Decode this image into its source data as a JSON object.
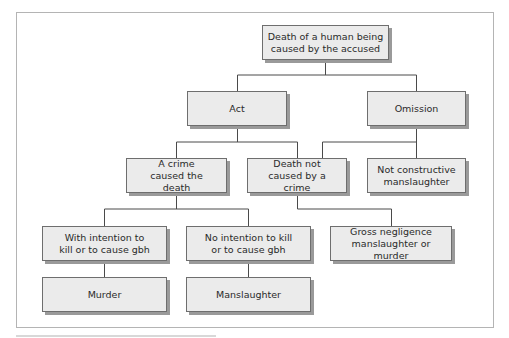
{
  "diagram": {
    "title": "",
    "nodes": [
      {
        "id": "root",
        "label": "Death of a human being caused by the accused",
        "lines": [
          "Death of a human being",
          "caused by the accused"
        ]
      },
      {
        "id": "act",
        "label": "Act",
        "lines": [
          "Act"
        ]
      },
      {
        "id": "omission",
        "label": "Omission",
        "lines": [
          "Omission"
        ]
      },
      {
        "id": "crime",
        "label": "A crime caused the death",
        "lines": [
          "A crime",
          "caused the death"
        ]
      },
      {
        "id": "not_crime",
        "label": "Death not caused by a crime",
        "lines": [
          "Death not",
          "caused by a crime"
        ]
      },
      {
        "id": "not_constructive",
        "label": "Not constructive manslaughter",
        "lines": [
          "Not constructive",
          "manslaughter"
        ]
      },
      {
        "id": "intention",
        "label": "With intention to kill or to cause gbh",
        "lines": [
          "With intention to",
          "kill or to cause gbh"
        ]
      },
      {
        "id": "no_intention",
        "label": "No intention to kill or to cause gbh",
        "lines": [
          "No intention to kill",
          "or to cause gbh"
        ]
      },
      {
        "id": "gross",
        "label": "Gross negligence manslaughter or murder",
        "lines": [
          "Gross negligence",
          "manslaughter or murder"
        ]
      },
      {
        "id": "murder",
        "label": "Murder",
        "lines": [
          "Murder"
        ]
      },
      {
        "id": "manslaughter",
        "label": "Manslaughter",
        "lines": [
          "Manslaughter"
        ]
      }
    ],
    "edges": [
      [
        "root",
        "act"
      ],
      [
        "root",
        "omission"
      ],
      [
        "act",
        "crime"
      ],
      [
        "act",
        "not_crime"
      ],
      [
        "omission",
        "not_crime"
      ],
      [
        "omission",
        "not_constructive"
      ],
      [
        "crime",
        "intention"
      ],
      [
        "crime",
        "no_intention"
      ],
      [
        "not_crime",
        "gross"
      ],
      [
        "intention",
        "murder"
      ],
      [
        "no_intention",
        "manslaughter"
      ]
    ]
  },
  "colors": {
    "box_fill": "#ebebeb",
    "box_border": "#6e6e6e",
    "shadow": "#9a9a9a",
    "line": "#4a4a4a",
    "frame": "#b4b4b4"
  }
}
